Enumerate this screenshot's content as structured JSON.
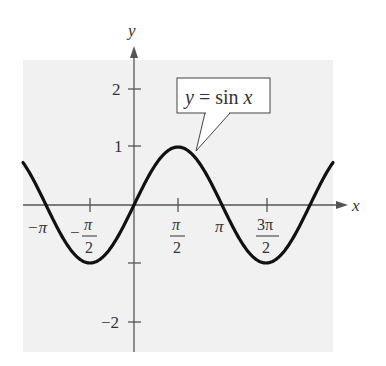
{
  "chart_data": {
    "type": "line",
    "title": "",
    "xlabel": "x",
    "ylabel": "y",
    "annotation": "y = sin x",
    "function": "sin(x)",
    "xlim": [
      -3.9,
      4.8
    ],
    "ylim": [
      -2.5,
      2.5
    ],
    "grid": false,
    "x_ticks": [
      {
        "value": -3.14159,
        "label": "−π"
      },
      {
        "value": -1.5708,
        "label": "−π/2"
      },
      {
        "value": 1.5708,
        "label": "π/2"
      },
      {
        "value": 3.14159,
        "label": "π"
      },
      {
        "value": 4.71239,
        "label": "3π/2"
      }
    ],
    "y_ticks": [
      {
        "value": 2,
        "label": "2"
      },
      {
        "value": 1,
        "label": "1"
      },
      {
        "value": -1,
        "label": ""
      },
      {
        "value": -2,
        "label": "−2"
      }
    ],
    "series": [
      {
        "name": "y = sin x",
        "x": [
          -3.1416,
          -1.5708,
          0,
          1.5708,
          3.1416,
          4.7124,
          6.2832
        ],
        "y": [
          0,
          -1,
          0,
          1,
          0,
          -1,
          0
        ]
      }
    ]
  },
  "labels": {
    "x_axis": "x",
    "y_axis": "y",
    "callout": "y = sin x",
    "tick_y2": "2",
    "tick_y1": "1",
    "tick_yneg2": "−2",
    "tick_negpi": "−π",
    "tick_negpi2_num": "π",
    "tick_negpi2_den": "2",
    "tick_pi2_num": "π",
    "tick_pi2_den": "2",
    "tick_pi": "π",
    "tick_3pi2_num": "3π",
    "tick_3pi2_den": "2"
  }
}
